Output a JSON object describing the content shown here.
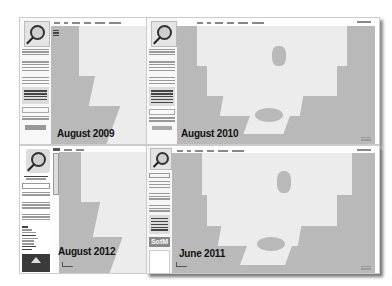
{
  "composite_title": "OpenStreetMap website evolution",
  "panels": [
    {
      "id": "aug2009",
      "caption": "August 2009",
      "logo_text": "OpenStreetMap",
      "logo_subtitle": "The Free Wiki World Map",
      "nav_tabs": [
        "View",
        "Edit",
        "History",
        "Export",
        "GPS Traces",
        "User Diaries"
      ],
      "map_links": [
        "Map",
        "Data",
        "Pub"
      ],
      "sidebar_links": [
        "Help & Wiki",
        "News blog",
        "Shop",
        "Map Key"
      ],
      "search_label": "Search",
      "search_placeholder": "",
      "donate_label": "Donate"
    },
    {
      "id": "aug2010",
      "caption": "August 2010",
      "logo_text": "OpenStreetMap",
      "logo_subtitle": "The Free Wiki World Map",
      "nav_tabs": [
        "View",
        "Edit",
        "History",
        "Export",
        "GPS Traces",
        "User Diaries"
      ],
      "sidebar_links": [
        "Help & Wiki",
        "Copyright & License",
        "News blog",
        "Shop",
        "Map Key"
      ],
      "search_label": "Search",
      "top_right": "log in | sign up",
      "attribution": "Licence / Terms"
    },
    {
      "id": "aug2012",
      "caption": "August 2012",
      "logo_text": "OpenStreetMap",
      "logo_subtitle": "The Free Wiki World Map",
      "nav_tabs": [
        "Edit",
        "History",
        "Export"
      ],
      "search_placeholder": "Search",
      "sidebar_links": [
        "Help",
        "About",
        "Copyright",
        "Community",
        "Community Blog",
        "Foundation",
        "GPS Traces",
        "User Diaries",
        "Map Key"
      ],
      "sponsor_label": "Hosting sponsor"
    },
    {
      "id": "jun2011",
      "caption": "June 2011",
      "logo_text": "OpenStreetMap",
      "nav_tabs": [
        "View",
        "Edit",
        "History",
        "Export",
        "GPS Traces",
        "User Diaries"
      ],
      "search_label": "Search",
      "sidebar_links": [
        "Help Centre",
        "Documentation",
        "Copyright & License",
        "Community Blog",
        "Foundation"
      ],
      "badge": "SotM",
      "top_right": "log in | sign up"
    }
  ]
}
